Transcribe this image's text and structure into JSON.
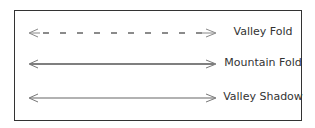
{
  "legend": {
    "items": [
      {
        "label": "Valley Fold",
        "style": "dashed"
      },
      {
        "label": "Mountain Fold",
        "style": "solid"
      },
      {
        "label": "Valley Shadow",
        "style": "solid"
      }
    ]
  },
  "colors": {
    "border": "#333333",
    "line": "#555555",
    "arrowhead": "#777777",
    "text": "#333333"
  }
}
